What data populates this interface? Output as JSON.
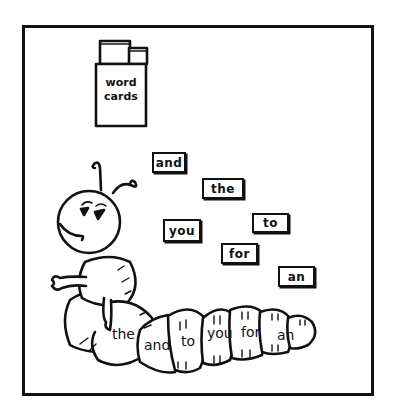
{
  "illustration": {
    "title": "word cards caterpillar activity",
    "box": {
      "label_line1": "word",
      "label_line2": "cards"
    },
    "cards": [
      {
        "word": "and",
        "x": 152,
        "y": 152,
        "w": 34,
        "h": 21
      },
      {
        "word": "the",
        "x": 202,
        "y": 178,
        "w": 42,
        "h": 21
      },
      {
        "word": "you",
        "x": 163,
        "y": 219,
        "w": 38,
        "h": 23
      },
      {
        "word": "to",
        "x": 252,
        "y": 213,
        "w": 37,
        "h": 20
      },
      {
        "word": "for",
        "x": 221,
        "y": 243,
        "w": 37,
        "h": 21
      },
      {
        "word": "an",
        "x": 278,
        "y": 266,
        "w": 37,
        "h": 21
      }
    ],
    "caterpillar_segments": [
      "the",
      "and",
      "to",
      "you",
      "for",
      "an"
    ],
    "colors": {
      "ink": "#111111",
      "paper": "#ffffff"
    }
  }
}
